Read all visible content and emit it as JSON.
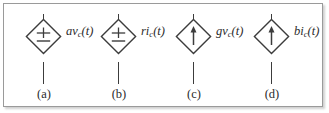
{
  "figure": {
    "type": "circuit-symbol-figure",
    "background_color": "#ffffff",
    "border_color": "#9a9a9a",
    "ink_color": "#3c3c3c",
    "sources": [
      {
        "caption": "(a)",
        "symbol": "dependent-voltage-source",
        "inner_glyph": "plus-minus",
        "label_main": "av",
        "label_sub": "c",
        "label_tail": "(t)",
        "label_full": "av_c(t)",
        "left": 12
      },
      {
        "caption": "(b)",
        "symbol": "dependent-voltage-source",
        "inner_glyph": "plus-minus",
        "label_main": "ri",
        "label_sub": "c",
        "label_tail": "(t)",
        "label_full": "ri_c(t)",
        "left": 87
      },
      {
        "caption": "(c)",
        "symbol": "dependent-current-source",
        "inner_glyph": "up-arrow",
        "label_main": "gv",
        "label_sub": "c",
        "label_tail": "(t)",
        "label_full": "gv_c(t)",
        "left": 162
      },
      {
        "caption": "(d)",
        "symbol": "dependent-current-source",
        "inner_glyph": "up-arrow",
        "label_main": "bi",
        "label_sub": "c",
        "label_tail": "(t)",
        "label_full": "bi_c(t)",
        "left": 240
      }
    ]
  }
}
